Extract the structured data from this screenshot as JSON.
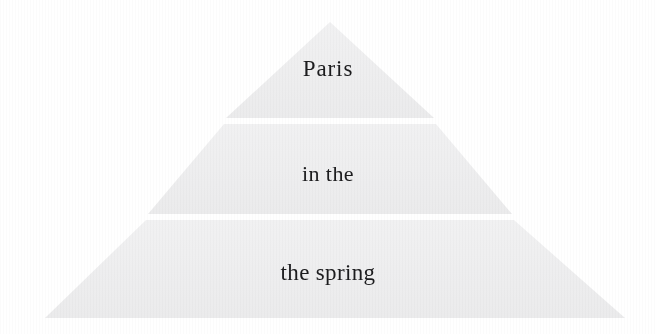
{
  "figure": {
    "name": "pyramid-diagram",
    "type": "pyramid",
    "tier_count": 3,
    "background_color": "#ffffff",
    "tier_fill_color": "#eeeeef",
    "text_color": "#1c1c1e",
    "tiers": [
      {
        "index": 1,
        "position": "apex",
        "label": "Paris"
      },
      {
        "index": 2,
        "position": "middle",
        "label": "in the"
      },
      {
        "index": 3,
        "position": "base",
        "label": "the spring"
      }
    ],
    "geometry": {
      "apex_x": 330,
      "apex_y": 22,
      "base_left_x": 45,
      "base_right_x": 625,
      "base_y": 318,
      "divider_1_top_y": 118,
      "divider_1_bottom_y": 124,
      "divider_2_top_y": 214,
      "divider_2_bottom_y": 220
    }
  }
}
